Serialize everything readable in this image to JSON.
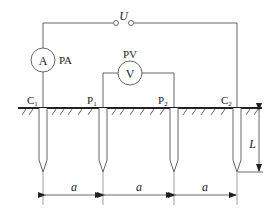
{
  "diagram": {
    "source": {
      "label": "U"
    },
    "ammeter": {
      "symbol": "A",
      "label": "PA"
    },
    "voltmeter": {
      "symbol": "V",
      "label": "PV"
    },
    "electrodes": [
      {
        "label": "C",
        "sub": "1"
      },
      {
        "label": "P",
        "sub": "1"
      },
      {
        "label": "P",
        "sub": "2"
      },
      {
        "label": "C",
        "sub": "2"
      }
    ],
    "spacings": [
      {
        "label": "a"
      },
      {
        "label": "a"
      },
      {
        "label": "a"
      }
    ],
    "depth": {
      "label": "L"
    },
    "colors": {
      "line": "#555555",
      "ground": "#222222",
      "text": "#222222"
    }
  }
}
